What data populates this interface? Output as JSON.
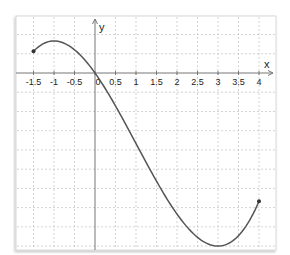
{
  "chart_data": {
    "type": "line",
    "title": "",
    "xlabel": "x",
    "ylabel": "y",
    "xlim": [
      -1.95,
      4.45
    ],
    "ylim": [
      -3.05,
      0.98
    ],
    "grid": true,
    "grid_style": "dashed",
    "x_tick_step": 0.5,
    "y_grid_step": 0.3333,
    "x_ticks": [
      -1.5,
      -1,
      -0.5,
      0,
      0.5,
      1,
      1.5,
      2,
      2.5,
      3,
      3.5,
      4
    ],
    "x_tick_labels": [
      "-1.5",
      "-1",
      "-0.5",
      "0",
      "0.5",
      "1",
      "1.5",
      "2",
      "2.5",
      "3",
      "3.5",
      "4"
    ],
    "y_tick_labels": [],
    "series": [
      {
        "name": "f(x)",
        "domain": [
          -1.5,
          4
        ],
        "endpoints_marked": true,
        "x": [
          -1.5,
          -1,
          -0.5,
          0,
          0.5,
          1,
          1.5,
          2,
          2.5,
          3,
          3.5,
          4
        ],
        "y": [
          0.375,
          0.556,
          0.458,
          0,
          -0.611,
          -1.222,
          -1.625,
          -1.778,
          -1.632,
          -3.0,
          -2.764,
          -2.222
        ],
        "key_points": {
          "start": [
            -1.5,
            0.375
          ],
          "local_max": [
            -1,
            0.556
          ],
          "zero": [
            0,
            0
          ],
          "local_min": [
            3,
            -3.0
          ],
          "end": [
            4,
            -2.222
          ]
        }
      }
    ],
    "style": {
      "curve_color": "#555555",
      "axis_color": "#777777",
      "grid_color": "#c8c8c8",
      "frame_color": "#d8d8d8",
      "point_color": "#333333"
    }
  },
  "labels": {
    "x_axis": "x",
    "y_axis": "y"
  }
}
